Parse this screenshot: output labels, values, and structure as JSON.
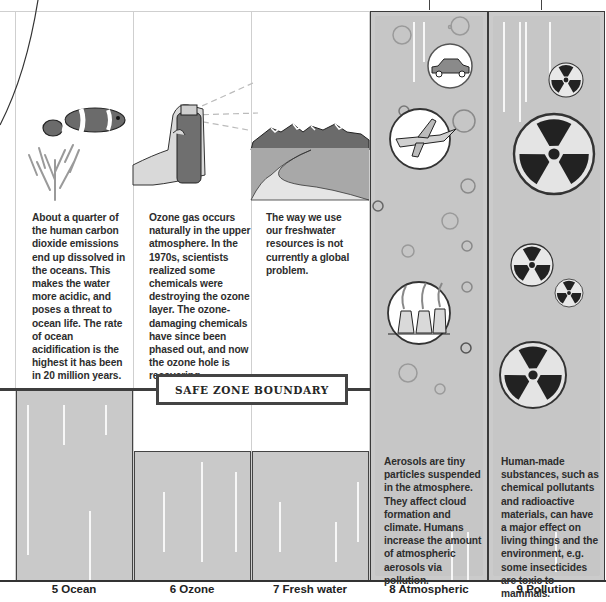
{
  "diagram": {
    "boundary_label": "SAFE ZONE BOUNDARY",
    "columns": [
      {
        "id": "ocean",
        "number": "5",
        "label": "5 Ocean",
        "illustration": "clownfish-and-coral-icon",
        "text": "About a quarter of the human carbon dioxide emissions end up dissolved in the oceans. This makes the water more acidic, and poses a threat to ocean life. The rate of ocean acidification is the highest it has been in 20 million years.",
        "status": "within-safe-zone"
      },
      {
        "id": "ozone",
        "number": "6",
        "label": "6 Ozone",
        "illustration": "spray-can-icon",
        "text": "Ozone gas occurs naturally in the upper atmosphere. In the 1970s, scientists realized some chemicals were destroying the ozone layer. The ozone-damaging chemicals have since been phased out, and now the ozone hole is recovering.",
        "status": "within-safe-zone"
      },
      {
        "id": "fresh-water",
        "number": "7",
        "label": "7 Fresh water",
        "illustration": "river-and-mountains-icon",
        "text": "The way we use our freshwater resources is not currently a global problem.",
        "status": "within-safe-zone"
      },
      {
        "id": "atmospheric",
        "number": "8",
        "label": "8 Atmospheric",
        "illustration": "car-plane-factory-icon",
        "text": "Aerosols are tiny particles suspended in the atmosphere. They affect cloud formation and climate. Humans increase the amount of atmospheric aerosols via pollution.",
        "status": "unknown"
      },
      {
        "id": "pollution",
        "number": "9",
        "label": "9 Pollution",
        "illustration": "radiation-symbol-icon",
        "text": "Human-made substances, such as chemical pollutants and radioactive materials, can have a major effect on living things and the environment, e.g. some insecticides are toxic to mammals.",
        "status": "unknown"
      }
    ],
    "colors": {
      "bar_fill": "#c9c9c9",
      "boundary_line": "#3e3e3e",
      "text": "#2d2d2d"
    }
  }
}
